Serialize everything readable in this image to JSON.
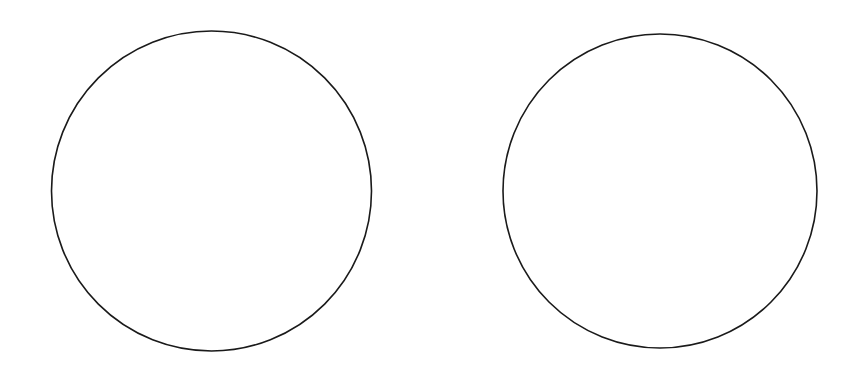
{
  "diagram": {
    "background": "#ffffff",
    "shapes": [
      {
        "id": "circle-left",
        "type": "circle",
        "stroke": "#1a1a1a",
        "fill": "none"
      },
      {
        "id": "circle-right",
        "type": "circle",
        "stroke": "#1a1a1a",
        "fill": "none"
      }
    ]
  }
}
